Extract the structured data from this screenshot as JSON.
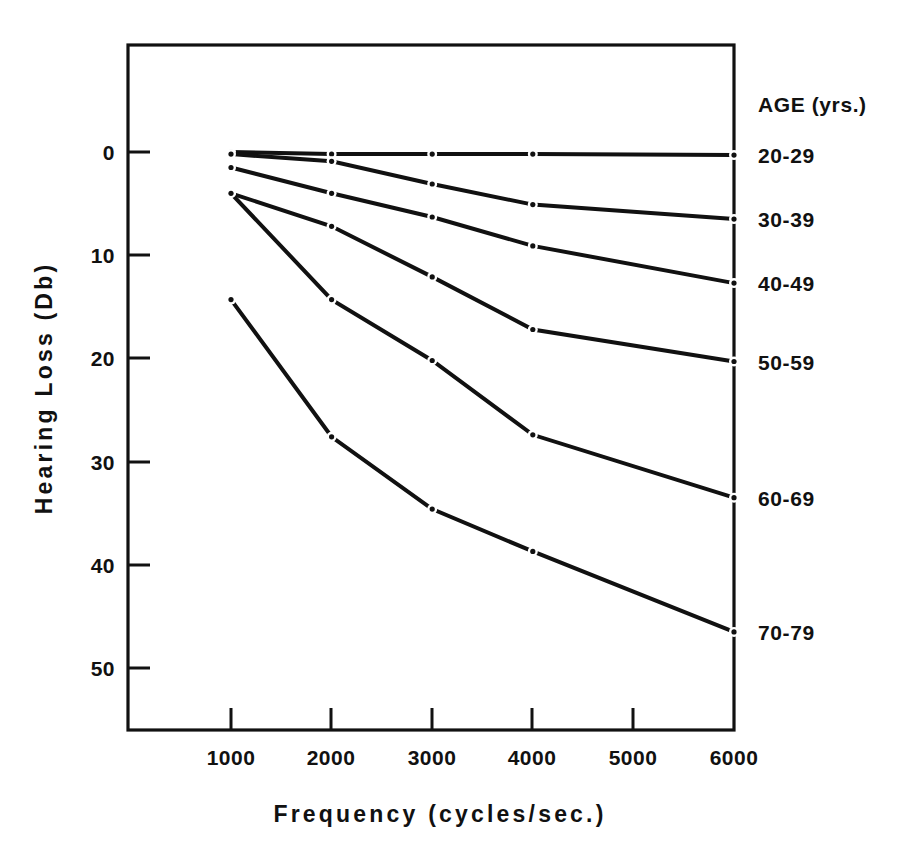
{
  "chart_data": {
    "type": "line",
    "title": "",
    "xlabel": "Frequency (cycles/sec.)",
    "ylabel": "Hearing Loss (Db)",
    "x": [
      1000,
      2000,
      3000,
      4000,
      6000
    ],
    "xtick_labels": [
      "1000",
      "2000",
      "3000",
      "4000",
      "5000",
      "6000"
    ],
    "xticks": [
      1000,
      2000,
      3000,
      4000,
      5000,
      6000
    ],
    "ytick_labels": [
      "0",
      "10",
      "20",
      "30",
      "40",
      "50"
    ],
    "yticks": [
      0,
      10,
      20,
      30,
      40,
      50
    ],
    "xlim": [
      600,
      6000
    ],
    "ylim": [
      -1,
      57
    ],
    "y_inverted": true,
    "grid": false,
    "legend_position": "right",
    "legend_title": "AGE (yrs.)",
    "marker": "dot",
    "line_color": "#111111",
    "series": [
      {
        "name": "20-29",
        "values": [
          0.0,
          0.2,
          0.2,
          0.2,
          0.3
        ]
      },
      {
        "name": "30-39",
        "values": [
          0.2,
          0.9,
          3.1,
          5.1,
          6.5
        ]
      },
      {
        "name": "40-49",
        "values": [
          1.5,
          4.0,
          6.3,
          9.1,
          12.7
        ]
      },
      {
        "name": "50-59",
        "values": [
          4.0,
          7.2,
          12.1,
          17.2,
          20.3
        ]
      },
      {
        "name": "60-69",
        "values": [
          4.0,
          14.3,
          20.2,
          27.4,
          33.5
        ]
      },
      {
        "name": "70-79",
        "values": [
          14.3,
          27.6,
          34.6,
          38.7,
          46.5
        ]
      }
    ]
  },
  "axes": {
    "x_title": "Frequency (cycles/sec.)",
    "y_title": "Hearing Loss (Db)"
  },
  "legend": {
    "title": "AGE (yrs.)",
    "items": [
      {
        "label": "20-29"
      },
      {
        "label": "30-39"
      },
      {
        "label": "40-49"
      },
      {
        "label": "50-59"
      },
      {
        "label": "60-69"
      },
      {
        "label": "70-79"
      }
    ]
  }
}
